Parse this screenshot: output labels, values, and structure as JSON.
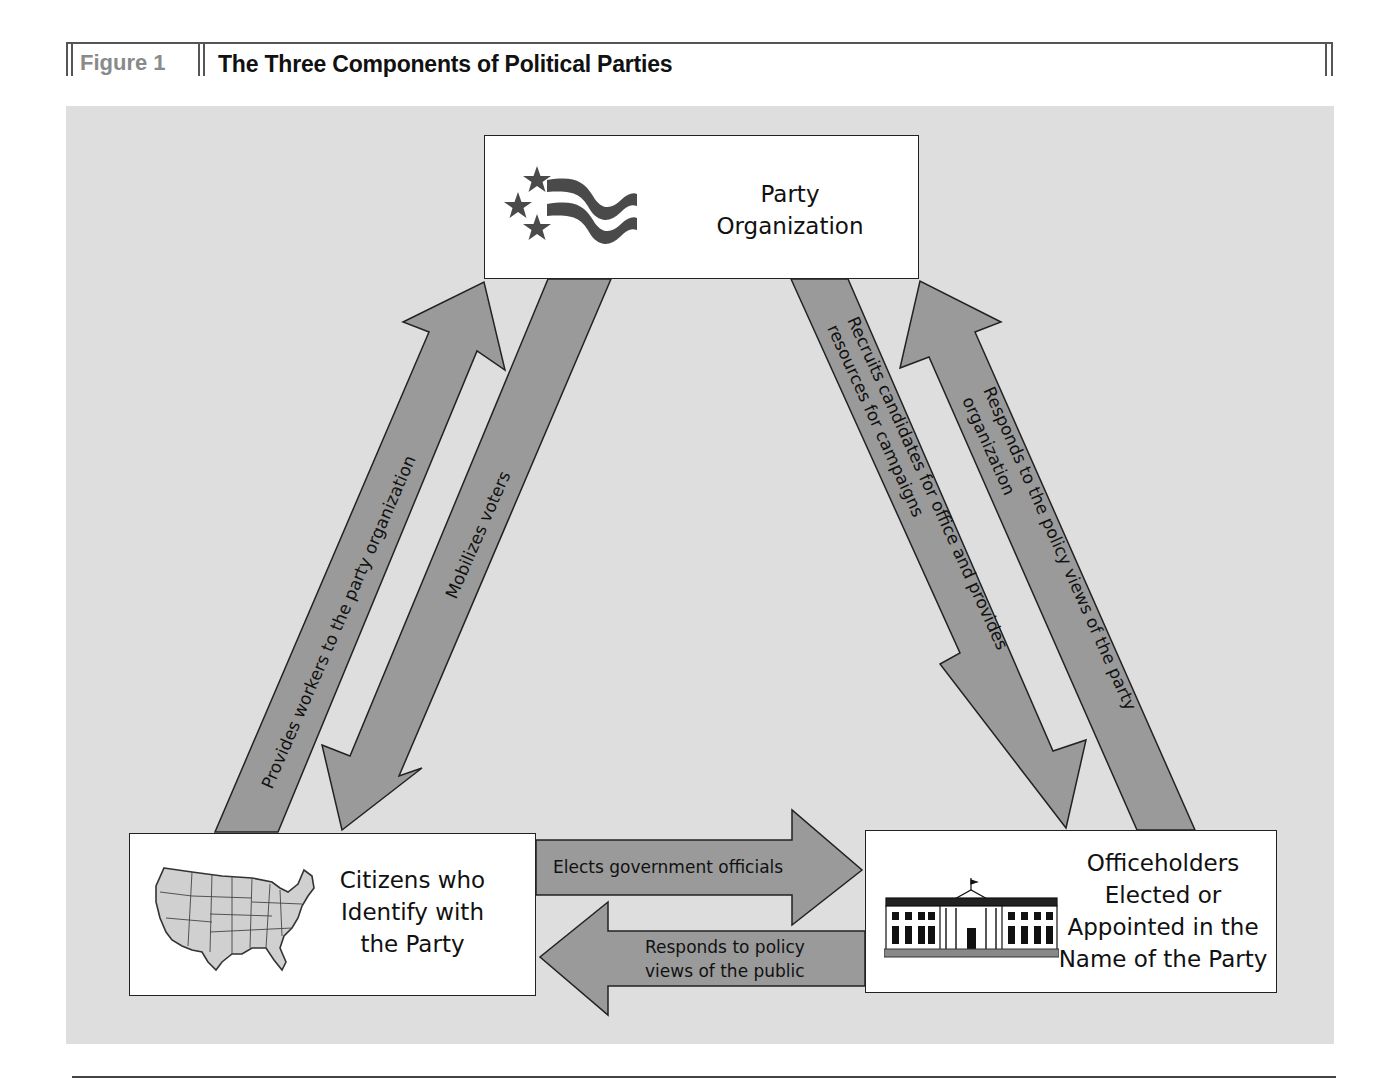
{
  "header": {
    "figure_label": "Figure 1",
    "title": "The Three Components of Political Parties"
  },
  "nodes": {
    "party_organization": {
      "lines": [
        "Party",
        "Organization"
      ],
      "icon": "flag-stars-icon"
    },
    "citizens": {
      "lines": [
        "Citizens who",
        "Identify with",
        "the Party"
      ],
      "icon": "us-map-icon"
    },
    "officeholders": {
      "lines": [
        "Officeholders",
        "Elected or",
        "Appointed in the",
        "Name of the Party"
      ],
      "icon": "white-house-icon"
    }
  },
  "arrows": {
    "provides_workers": {
      "from": "Citizens who Identify with the Party",
      "to": "Party Organization",
      "label": "Provides workers to the party organization"
    },
    "mobilizes_voters": {
      "from": "Party Organization",
      "to": "Citizens who Identify with the Party",
      "label": "Mobilizes voters"
    },
    "recruits_candidates": {
      "from": "Party Organization",
      "to": "Officeholders Elected or Appointed in the Name of the Party",
      "label_line1": "Recruits candidates for office and provides",
      "label_line2": "resources for campaigns"
    },
    "responds_party": {
      "from": "Officeholders Elected or Appointed in the Name of the Party",
      "to": "Party Organization",
      "label_line1": "Responds to the policy views of the party",
      "label_line2": "organization"
    },
    "elects_officials": {
      "from": "Citizens who Identify with the Party",
      "to": "Officeholders Elected or Appointed in the Name of the Party",
      "label": "Elects government officials"
    },
    "responds_public": {
      "from": "Officeholders Elected or Appointed in the Name of the Party",
      "to": "Citizens who Identify with the Party",
      "label_line1": "Responds to policy",
      "label_line2": "views of the public"
    }
  },
  "colors": {
    "panel_background": "#dedede",
    "arrow_fill": "#9a9a9a",
    "arrow_stroke": "#222222",
    "box_fill": "#ffffff",
    "figure_label": "#8a8a8a",
    "flag_stripes": "#4a4a4a"
  }
}
